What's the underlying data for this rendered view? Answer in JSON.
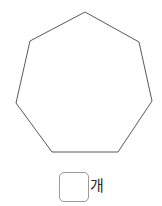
{
  "figure": {
    "shape_name": "heptagon",
    "sides": 7,
    "stroke_color": "#595959",
    "fill_color": "#ffffff",
    "stroke_width": 1,
    "vertices": [
      [
        85,
        12
      ],
      [
        139,
        42
      ],
      [
        152,
        101
      ],
      [
        118,
        152
      ],
      [
        52,
        152
      ],
      [
        16,
        103
      ],
      [
        30,
        41
      ]
    ]
  },
  "answer": {
    "value": "",
    "placeholder": "",
    "unit_label": "개",
    "box_border_color": "#9a9a9a"
  },
  "page": {
    "background_color": "#ffffff",
    "width": 162,
    "height": 206
  }
}
